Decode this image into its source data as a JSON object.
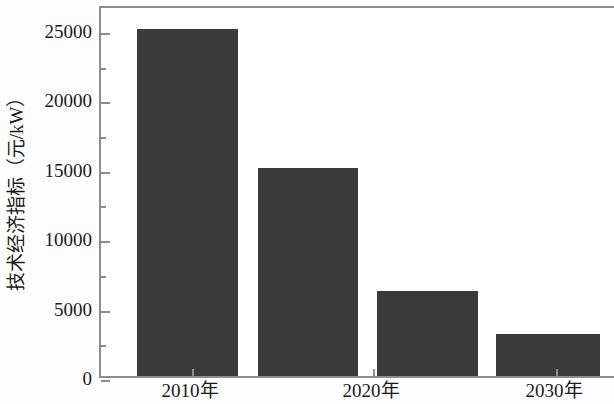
{
  "chart_data": {
    "type": "bar",
    "title": "",
    "xlabel": "",
    "ylabel": "技术经济指标（元/kW）",
    "categories": [
      "2010年",
      "",
      "2020年",
      "2030年"
    ],
    "values": [
      25000,
      15000,
      6100,
      3000
    ],
    "ylim": [
      0,
      26800
    ],
    "yticks": [
      0,
      5000,
      10000,
      15000,
      20000,
      25000
    ],
    "ytick_labels": [
      "0",
      "5000",
      "10000",
      "15000",
      "20000",
      "25000"
    ],
    "yminor_ticks": [
      2500,
      7500,
      12500,
      17500,
      22500
    ],
    "xtick_labels": [
      "2010年",
      "2020年",
      "2030年"
    ],
    "grid": false,
    "legend": null,
    "bar_color": "#3a3a3a",
    "axis_color": "#8d8d8d",
    "text_color": "#1a1a1a",
    "bars": [
      {
        "label": "2010年",
        "value": 25000,
        "x_left_px": 135,
        "x_right_px": 236
      },
      {
        "label": "",
        "value": 15000,
        "x_left_px": 256,
        "x_right_px": 356
      },
      {
        "label": "2020年",
        "value": 6100,
        "x_left_px": 375,
        "x_right_px": 476
      },
      {
        "label": "2030年",
        "value": 3000,
        "x_left_px": 494,
        "x_right_px": 598
      }
    ],
    "xtick_positions_px": [
      190,
      371,
      554
    ]
  }
}
